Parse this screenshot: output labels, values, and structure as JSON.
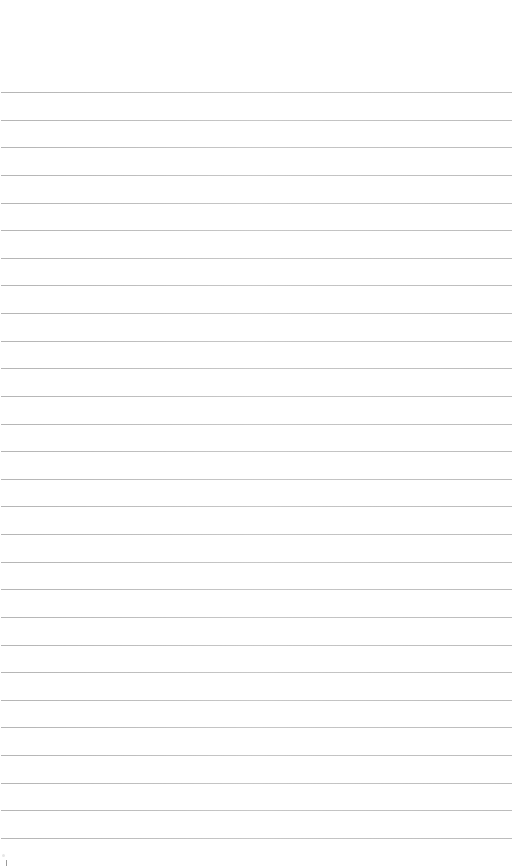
{
  "page": {
    "type": "lined-paper",
    "background_color": "#ffffff",
    "rule_color": "#b4b4b4",
    "rule_count": 28,
    "first_rule_y": 92,
    "rule_spacing": 27.63,
    "rule_left": 1,
    "rule_width": 511,
    "text_content": []
  },
  "marks": [
    {
      "name": "corner-tick",
      "x": 6,
      "y": 860
    }
  ]
}
